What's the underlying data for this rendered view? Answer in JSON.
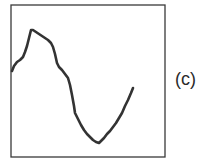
{
  "figure": {
    "label": "(c)",
    "frame": {
      "x": 11,
      "y": 5,
      "width": 154,
      "height": 152,
      "stroke": "#3a3a3a"
    },
    "curve": {
      "stroke": "#333333",
      "stroke_width": 2.6,
      "points": [
        [
          12,
          71
        ],
        [
          14,
          66
        ],
        [
          17,
          62
        ],
        [
          20,
          60
        ],
        [
          23,
          57
        ],
        [
          25,
          52
        ],
        [
          27,
          46
        ],
        [
          29,
          38
        ],
        [
          31,
          30
        ],
        [
          33,
          30
        ],
        [
          36,
          32
        ],
        [
          39,
          34
        ],
        [
          42,
          36
        ],
        [
          45,
          38
        ],
        [
          48,
          40
        ],
        [
          51,
          43
        ],
        [
          53,
          47
        ],
        [
          55,
          54
        ],
        [
          57,
          63
        ],
        [
          59,
          67
        ],
        [
          62,
          70
        ],
        [
          65,
          74
        ],
        [
          68,
          78
        ],
        [
          70,
          85
        ],
        [
          72,
          95
        ],
        [
          74,
          106
        ],
        [
          75,
          113
        ],
        [
          77,
          117
        ],
        [
          79,
          121
        ],
        [
          81,
          125
        ],
        [
          84,
          130
        ],
        [
          87,
          134
        ],
        [
          90,
          137
        ],
        [
          93,
          140
        ],
        [
          96,
          142
        ],
        [
          99,
          143
        ],
        [
          101,
          141
        ],
        [
          104,
          138
        ],
        [
          107,
          134
        ],
        [
          110,
          131
        ],
        [
          113,
          127
        ],
        [
          116,
          123
        ],
        [
          119,
          118
        ],
        [
          122,
          113
        ],
        [
          125,
          106
        ],
        [
          128,
          100
        ],
        [
          131,
          93
        ],
        [
          133,
          88
        ]
      ]
    }
  }
}
